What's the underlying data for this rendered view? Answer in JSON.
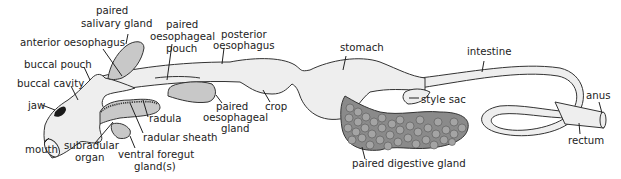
{
  "diagram": {
    "colors": {
      "gut_fill": "#eeeeee",
      "gland_fill": "#c8c8c8",
      "digestive_gland_fill": "#8a8a8a",
      "digestive_gland_lobe": "#a4a4a4",
      "jaw_fill": "#1a1a1a",
      "outline": "#333333"
    },
    "labels": {
      "paired_salivary_gland_l1": "paired",
      "paired_salivary_gland_l2": "salivary gland",
      "anterior_oesophagus": "anterior oesophagus",
      "buccal_pouch": "buccal pouch",
      "buccal_cavity": "buccal cavity",
      "jaw": "jaw",
      "mouth": "mouth",
      "subradular_organ_l1": "subradular",
      "subradular_organ_l2": "organ",
      "ventral_foregut_gland_l1": "ventral foregut",
      "ventral_foregut_gland_l2": "gland(s)",
      "radula": "radula",
      "radular_sheath": "radular sheath",
      "paired_oesophageal_pouch_l1": "paired",
      "paired_oesophageal_pouch_l2": "oesophageal",
      "paired_oesophageal_pouch_l3": "pouch",
      "posterior_oesophagus_l1": "posterior",
      "posterior_oesophagus_l2": "oesophagus",
      "paired_oesophageal_gland_l1": "paired",
      "paired_oesophageal_gland_l2": "oesophageal",
      "paired_oesophageal_gland_l3": "gland",
      "crop": "crop",
      "stomach": "stomach",
      "style_sac": "style sac",
      "paired_digestive_gland": "paired digestive gland",
      "intestine": "intestine",
      "anus": "anus",
      "rectum": "rectum"
    }
  }
}
